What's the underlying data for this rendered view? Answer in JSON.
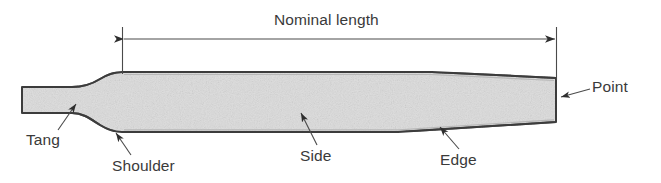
{
  "diagram": {
    "title": "Nominal length",
    "colors": {
      "body_fill": "#dcdcdc",
      "body_stroke": "#3c3c3c",
      "text": "#3a3a3a",
      "leader_line": "#4a4a4a",
      "dimension_line": "#4a4a4a",
      "background": "#ffffff"
    },
    "dimension": {
      "label": "Nominal length",
      "start_x": 122,
      "end_x": 556,
      "line_y": 39,
      "style": "double-headed-arrow"
    },
    "callouts": [
      {
        "id": "tang",
        "label": "Tang",
        "label_x": 26,
        "label_y": 131,
        "leader_from_x": 58,
        "leader_from_y": 130,
        "leader_to_x": 75,
        "leader_to_y": 103,
        "arrow": "up-right"
      },
      {
        "id": "shoulder",
        "label": "Shoulder",
        "label_x": 112,
        "label_y": 157,
        "leader_from_x": 131,
        "leader_from_y": 155,
        "leader_to_x": 116,
        "leader_to_y": 131,
        "arrow": "up-left"
      },
      {
        "id": "side",
        "label": "Side",
        "label_x": 300,
        "label_y": 147,
        "leader_from_x": 317,
        "leader_from_y": 145,
        "leader_to_x": 301,
        "leader_to_y": 112,
        "arrow": "up-left"
      },
      {
        "id": "edge",
        "label": "Edge",
        "label_x": 440,
        "label_y": 151,
        "leader_from_x": 459,
        "leader_from_y": 149,
        "leader_to_x": 440,
        "leader_to_y": 126,
        "arrow": "up-left"
      },
      {
        "id": "point",
        "label": "Point",
        "label_x": 592,
        "label_y": 78,
        "leader_from_x": 588,
        "leader_from_y": 91,
        "leader_to_x": 561,
        "leader_to_y": 98,
        "arrow": "left"
      }
    ],
    "geometry": {
      "tang_left_x": 22,
      "tang_top_y": 87,
      "tang_bottom_y": 113,
      "shoulder_x": 122,
      "body_top_y": 72,
      "body_bottom_y": 132,
      "point_x": 556,
      "point_top_y": 78,
      "point_bottom_y": 122,
      "top_taper_start_x": 432,
      "bottom_taper_start_x": 398
    }
  }
}
